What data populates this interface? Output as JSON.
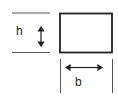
{
  "diagram": {
    "height_label": "h",
    "width_label": "b",
    "stroke_color": "#222222",
    "guide_color": "#555555"
  }
}
